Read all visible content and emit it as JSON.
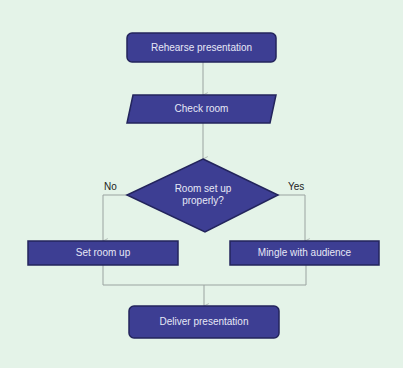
{
  "diagram": {
    "type": "flowchart",
    "background_color": "#e4f3e8",
    "shape_fill": "#3d3e93",
    "shape_border": "#23245c",
    "connector_color": "#9aa3a0",
    "text_color": "#e6e8f6",
    "nodes": [
      {
        "id": "rehearse",
        "shape": "rounded-rectangle",
        "label": "Rehearse presentation"
      },
      {
        "id": "check_room",
        "shape": "parallelogram",
        "label": "Check room"
      },
      {
        "id": "decision",
        "shape": "diamond",
        "label_line1": "Room set up",
        "label_line2": "properly?"
      },
      {
        "id": "set_room_up",
        "shape": "rectangle",
        "label": "Set room up"
      },
      {
        "id": "mingle",
        "shape": "rectangle",
        "label": "Mingle with audience"
      },
      {
        "id": "deliver",
        "shape": "rounded-rectangle",
        "label": "Deliver presentation"
      }
    ],
    "edges": [
      {
        "from": "rehearse",
        "to": "check_room",
        "label": ""
      },
      {
        "from": "check_room",
        "to": "decision",
        "label": ""
      },
      {
        "from": "decision",
        "to": "set_room_up",
        "label": "No"
      },
      {
        "from": "decision",
        "to": "mingle",
        "label": "Yes"
      },
      {
        "from": "set_room_up",
        "to": "deliver",
        "label": ""
      },
      {
        "from": "mingle",
        "to": "deliver",
        "label": ""
      }
    ],
    "edge_labels": {
      "no": "No",
      "yes": "Yes"
    }
  }
}
